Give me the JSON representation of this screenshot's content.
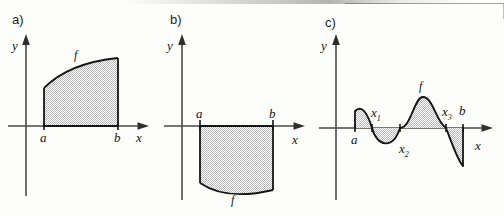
{
  "figure": {
    "width": 504,
    "height": 216,
    "background_color": "#fdfdfc",
    "ink_color": "#151515",
    "shading_color": "#c9c9c9"
  },
  "panels": [
    {
      "id": "a",
      "tag": "a)",
      "y_axis_label": "y",
      "x_axis_label": "x",
      "curve_label": "f",
      "lower_limit_label": "a",
      "upper_limit_label": "b",
      "region": "above-axis",
      "curve_shape": "increasing concave-down",
      "roots": []
    },
    {
      "id": "b",
      "tag": "b)",
      "y_axis_label": "y",
      "x_axis_label": "x",
      "curve_label": "f",
      "lower_limit_label": "a",
      "upper_limit_label": "b",
      "region": "below-axis",
      "curve_shape": "dips below then rises",
      "roots": []
    },
    {
      "id": "c",
      "tag": "c)",
      "y_axis_label": "y",
      "x_axis_label": "x",
      "curve_label": "f",
      "lower_limit_label": "a",
      "upper_limit_label": "b",
      "region": "alternating above and below axis",
      "curve_shape": "oscillating with three interior zeros",
      "roots": [
        "x",
        "x",
        "x"
      ],
      "root_labels": [
        {
          "base": "x",
          "sub": "1"
        },
        {
          "base": "x",
          "sub": "2"
        },
        {
          "base": "x",
          "sub": "3"
        }
      ]
    }
  ]
}
